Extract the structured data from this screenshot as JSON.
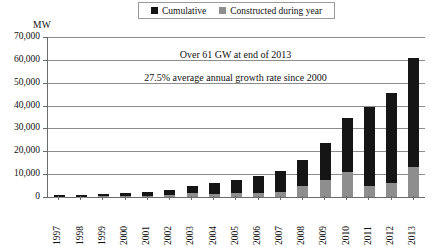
{
  "chart_data": {
    "type": "bar",
    "title": "",
    "xlabel": "",
    "ylabel": "MW",
    "ylim": [
      0,
      70000
    ],
    "ytick_values": [
      70000,
      60000,
      50000,
      40000,
      30000,
      20000,
      10000,
      0
    ],
    "ytick_labels": [
      "70,000",
      "60,000",
      "50,000",
      "40,000",
      "30,000",
      "20,000",
      "10,000",
      "0"
    ],
    "grid": true,
    "stacked": true,
    "legend_position": "top-center",
    "categories": [
      "1997",
      "1998",
      "1999",
      "2000",
      "2001",
      "2002",
      "2003",
      "2004",
      "2005",
      "2006",
      "2007",
      "2008",
      "2009",
      "2010",
      "2011",
      "2012",
      "2013"
    ],
    "series": [
      {
        "name": "Cumulative",
        "color": "#151515",
        "values": [
          700,
          900,
          1200,
          1600,
          2100,
          3000,
          4800,
          6000,
          7600,
          9200,
          11200,
          16200,
          23500,
          34500,
          39500,
          45500,
          61000
        ]
      },
      {
        "name": "Constructed during year",
        "color": "#8e8e8e",
        "values": [
          200,
          200,
          300,
          400,
          500,
          900,
          1800,
          1200,
          1600,
          1600,
          2000,
          5000,
          7300,
          11000,
          5000,
          6000,
          13000
        ]
      }
    ],
    "annotations": [
      "Over 61 GW at end of 2013",
      "27.5% average annual growth rate since 2000"
    ],
    "legend_entries": [
      {
        "label": "Cumulative",
        "color": "#151515"
      },
      {
        "label": "Constructed during year",
        "color": "#8e8e8e"
      }
    ]
  }
}
